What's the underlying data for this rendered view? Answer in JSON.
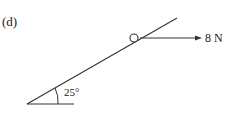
{
  "diagram": {
    "part_label": "(d)",
    "angle_label": "25°",
    "force_label": "8 N",
    "colors": {
      "stroke": "#333333",
      "text": "#1a1a1a",
      "background": "#ffffff"
    }
  }
}
